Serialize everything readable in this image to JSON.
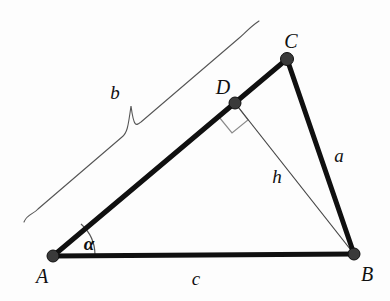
{
  "figure": {
    "type": "geometry-diagram",
    "background_color": "#fdfdfd",
    "stroke_color": "#101010",
    "thin_stroke_color": "#555555",
    "point_fill_color": "#3a3a3a",
    "width": 390,
    "height": 301
  },
  "points": {
    "A": {
      "label": "A",
      "x": 53,
      "y": 256,
      "label_x": 42,
      "label_y": 276
    },
    "B": {
      "label": "B",
      "x": 354,
      "y": 254,
      "label_x": 367,
      "label_y": 274
    },
    "C": {
      "label": "C",
      "x": 287,
      "y": 59,
      "label_x": 291,
      "label_y": 41
    },
    "D": {
      "label": "D",
      "x": 235,
      "y": 103,
      "label_x": 223,
      "label_y": 87
    }
  },
  "segments": [
    {
      "name": "side-c",
      "from": "A",
      "to": "B",
      "weight": "thick"
    },
    {
      "name": "side-b",
      "from": "A",
      "to": "C",
      "weight": "thick"
    },
    {
      "name": "side-a",
      "from": "C",
      "to": "B",
      "weight": "thick"
    },
    {
      "name": "altitude-h",
      "from": "D",
      "to": "B",
      "weight": "thin"
    }
  ],
  "side_labels": {
    "a": {
      "text": "a",
      "x": 339,
      "y": 155
    },
    "b": {
      "text": "b",
      "x": 115,
      "y": 92
    },
    "c": {
      "text": "c",
      "x": 196,
      "y": 278
    },
    "h": {
      "text": "h",
      "x": 277,
      "y": 176
    }
  },
  "angle": {
    "name": "alpha-at-A",
    "symbol": "α",
    "label_x": 89,
    "label_y": 243,
    "arc_radius": 42,
    "vertex": "A"
  },
  "right_angle": {
    "name": "right-angle-at-D",
    "at": "D",
    "size": 20,
    "marker": "square"
  },
  "brace": {
    "name": "brace-b",
    "spans": "side-b",
    "start_x": 24,
    "start_y": 222,
    "end_x": 259,
    "end_y": 21,
    "notch_x": 131,
    "notch_y": 106
  }
}
